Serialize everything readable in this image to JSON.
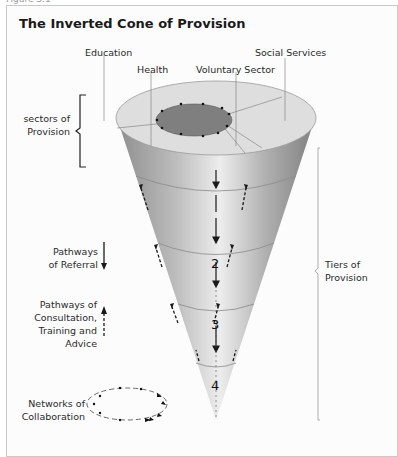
{
  "caption": "Figure 3.1",
  "title": "The Inverted Cone of Provision",
  "sectors": {
    "education": "Education",
    "health": "Health",
    "voluntary": "Voluntary Sector",
    "social": "Social Services"
  },
  "left_labels": {
    "sectors_line1": "sectors of",
    "sectors_line2": "Provision",
    "referral_line1": "Pathways",
    "referral_line2": "of Referral",
    "consult_line1": "Pathways of",
    "consult_line2": "Consultation,",
    "consult_line3": "Training and",
    "consult_line4": "Advice",
    "networks_line1": "Networks of",
    "networks_line2": "Collaboration"
  },
  "right_labels": {
    "tiers_line1": "Tiers of",
    "tiers_line2": "Provision"
  },
  "tiers": [
    "1",
    "2",
    "3",
    "4"
  ],
  "colors": {
    "cone_dark": "#8a8a8a",
    "cone_light": "#e2e2e2",
    "top_face": "#dcdcdc",
    "inner_ellipse": "#7d7d7d",
    "text": "#2a2a2a"
  }
}
